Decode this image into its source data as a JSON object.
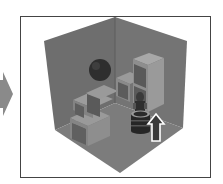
{
  "figure": {
    "colors": {
      "background": "#ffffff",
      "frame": "#444444",
      "pointer_arrow": "#8a8a8a",
      "left_wall": "#6e6e6e",
      "right_wall": "#727272",
      "floor": "#7a7a7a",
      "box_top": "#9a9a9a",
      "box_front": "#808080",
      "box_panel": "#5e5e5e",
      "sphere": "#2e2e2e",
      "robot": "#2a2a2a",
      "robot_light": "#9c9c9c",
      "up_arrow_outline": "#ffffff",
      "up_arrow_fill": "#3a3a3a"
    }
  },
  "pointer_arrow": {
    "direction": "right",
    "icon": "right-arrow-icon"
  },
  "scene_objects": [
    {
      "name": "sphere",
      "icon": "sphere-icon"
    },
    {
      "name": "stairs",
      "icon": "stairs-icon"
    },
    {
      "name": "tall-stack",
      "icon": "stack-icon"
    },
    {
      "name": "robot",
      "icon": "robot-icon"
    },
    {
      "name": "up-arrow",
      "icon": "up-arrow-icon",
      "direction": "up"
    }
  ]
}
